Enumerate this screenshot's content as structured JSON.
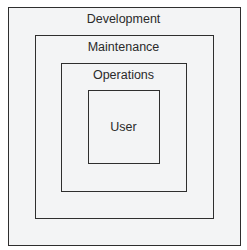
{
  "diagram": {
    "type": "nested-layers",
    "layers": [
      {
        "label": "Development"
      },
      {
        "label": "Maintenance"
      },
      {
        "label": "Operations"
      },
      {
        "label": "User"
      }
    ],
    "colors": {
      "border": "#2e2e2e",
      "fill": "#f3f4f5",
      "text": "#2a2a2a"
    }
  }
}
